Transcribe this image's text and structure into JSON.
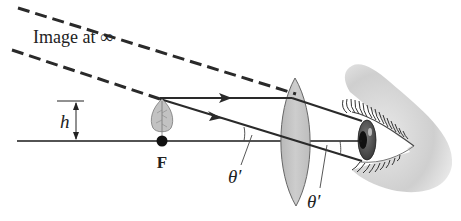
{
  "title_label": "Image at ∞",
  "height_label": "h",
  "focal_label": "F",
  "angle_label_left": "θ′",
  "angle_label_right": "θ′",
  "elements": {
    "object": "leaf-object",
    "lens": "converging-lens",
    "observer": "eye"
  },
  "colors": {
    "ray": "#2a2a2a",
    "axis": "#1a1a1a",
    "lens_fill": "#c4c4c4",
    "lens_stroke": "#6a6a6a",
    "leaf_fill": "#bdbdbd",
    "skin": "#d6d6d6",
    "iris": "#555555",
    "pupil": "#111111"
  }
}
